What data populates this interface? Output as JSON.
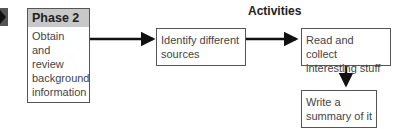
{
  "phase": {
    "title": "Phase 2",
    "description_lines": [
      "Obtain and",
      "review",
      "background",
      "information"
    ],
    "indicator_color": "#444444"
  },
  "activities": {
    "heading": "Activities",
    "steps": [
      {
        "lines": [
          "Identify different",
          "sources"
        ]
      },
      {
        "lines": [
          "Read and collect",
          "interesting stuff"
        ]
      },
      {
        "lines": [
          "Write a",
          "summary of it"
        ]
      }
    ]
  },
  "colors": {
    "header_fill": "#c8c8c8",
    "border": "#555555",
    "arrow": "#111111"
  }
}
